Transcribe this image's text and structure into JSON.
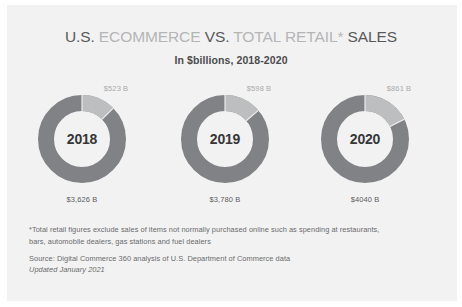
{
  "title": {
    "part1": "U.S.",
    "part2": "ECOMMERCE",
    "part3": "VS.",
    "part4": "TOTAL RETAIL*",
    "part5": "SALES",
    "subtitle": "In $billions, 2018-2020"
  },
  "colors": {
    "background": "#f2f2f2",
    "title_dark": "#58595b",
    "title_light": "#b4b5b7",
    "ring_total": "#808285",
    "ring_ecommerce": "#bcbec0",
    "year_text": "#363739",
    "top_label": "#a9aaac",
    "bottom_label": "#5c5d5f",
    "footnote": "#6a6b6d"
  },
  "footnotes": {
    "asterisk_line1": "*Total retail figures exclude sales of items not normally purchased online such as spending at restaurants,",
    "asterisk_line2": "bars, automobile dealers, gas stations and fuel dealers",
    "source": "Source: Digital Commerce 360 analysis of U.S. Department of Commerce data",
    "updated": "Updated January 2021"
  },
  "chart_data": {
    "type": "pie",
    "title": "U.S. ECOMMERCE VS. TOTAL RETAIL* SALES",
    "subtitle": "In $billions, 2018-2020",
    "unit": "$billions",
    "legend_position": "none",
    "series": [
      {
        "name": "Ecommerce",
        "values": [
          523,
          598,
          861
        ]
      },
      {
        "name": "Total retail",
        "values": [
          3626,
          3780,
          4040
        ]
      }
    ],
    "categories": [
      "2018",
      "2019",
      "2020"
    ],
    "donuts": [
      {
        "year": "2018",
        "ecommerce_value": 523,
        "ecommerce_label": "$523 B",
        "total_value": 3626,
        "total_label": "$3,626 B",
        "ecommerce_share_pct": 12.6
      },
      {
        "year": "2019",
        "ecommerce_value": 598,
        "ecommerce_label": "$598 B",
        "total_value": 3780,
        "total_label": "$3,780 B",
        "ecommerce_share_pct": 13.7
      },
      {
        "year": "2020",
        "ecommerce_value": 861,
        "ecommerce_label": "$861 B",
        "total_value": 4040,
        "total_label": "$4040 B",
        "ecommerce_share_pct": 17.6
      }
    ]
  }
}
